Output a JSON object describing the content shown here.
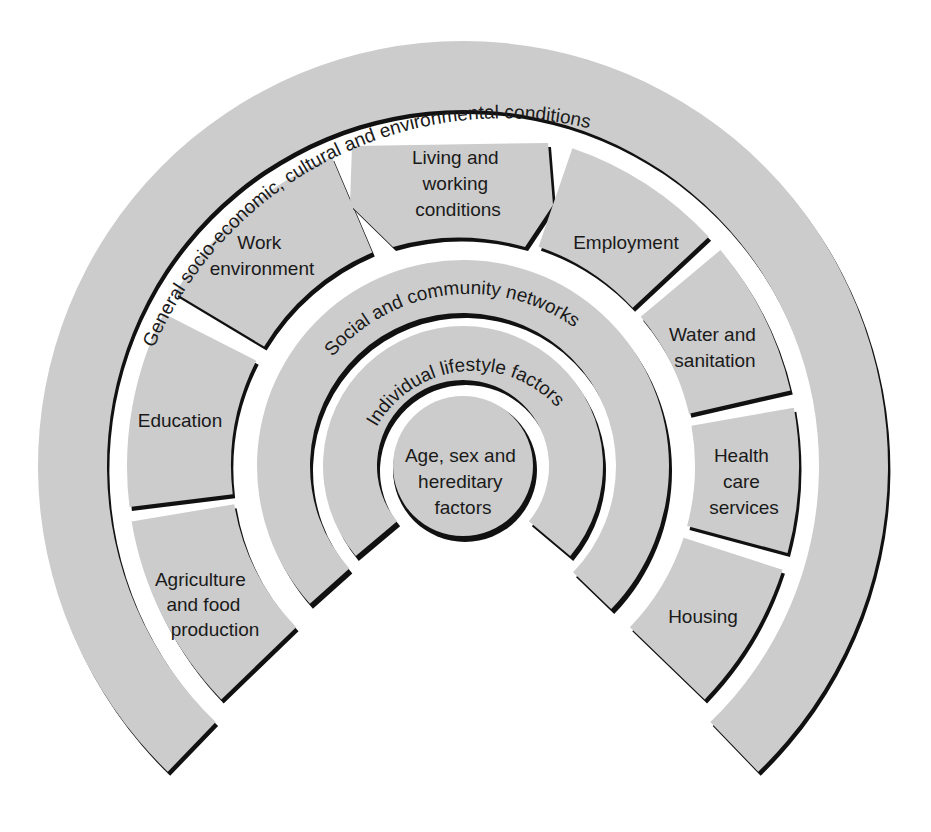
{
  "diagram": {
    "colors": {
      "fill": "#cccccc",
      "outline": "#111111",
      "background": "#ffffff",
      "text": "#1a1a1a"
    },
    "layers": {
      "outer": {
        "label": "General socio-economic, cultural and environmental conditions"
      },
      "social": {
        "label": "Social and community networks"
      },
      "individual": {
        "label": "Individual lifestyle factors"
      },
      "core": {
        "lines": [
          "Age, sex and",
          "hereditary",
          "factors"
        ]
      }
    },
    "sectors": [
      {
        "id": "agriculture",
        "lines": [
          "Agriculture",
          "and food",
          "production"
        ]
      },
      {
        "id": "education",
        "lines": [
          "Education"
        ]
      },
      {
        "id": "work-environment",
        "lines": [
          "Work",
          "environment"
        ]
      },
      {
        "id": "living-working",
        "lines": [
          "Living and",
          "working",
          "conditions"
        ]
      },
      {
        "id": "employment",
        "lines": [
          "Employment"
        ]
      },
      {
        "id": "water-sanitation",
        "lines": [
          "Water and",
          "sanitation"
        ]
      },
      {
        "id": "health-care",
        "lines": [
          "Health",
          "care",
          "services"
        ]
      },
      {
        "id": "housing",
        "lines": [
          "Housing"
        ]
      }
    ]
  }
}
